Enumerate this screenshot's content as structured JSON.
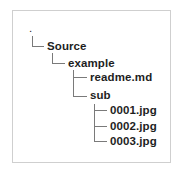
{
  "tree": {
    "root": {
      "label": "."
    },
    "source": {
      "label": "Source"
    },
    "example": {
      "label": "example"
    },
    "readme": {
      "label": "readme.md"
    },
    "sub": {
      "label": "sub"
    },
    "files": [
      {
        "label": "0001.jpg"
      },
      {
        "label": "0002.jpg"
      },
      {
        "label": "0003.jpg"
      }
    ]
  },
  "colors": {
    "text": "#1e1e1e",
    "connector": "#7a7a7a",
    "border": "#cfcfcf",
    "background": "#ffffff"
  }
}
